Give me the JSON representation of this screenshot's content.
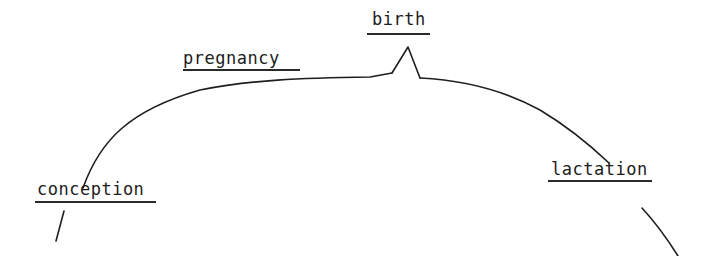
{
  "diagram": {
    "type": "life-cycle curve",
    "stroke_color": "#1e1e1e",
    "background": "#ffffff",
    "labels": [
      {
        "id": "conception",
        "text": "conception"
      },
      {
        "id": "pregnancy",
        "text": "pregnancy"
      },
      {
        "id": "birth",
        "text": "birth"
      },
      {
        "id": "lactation",
        "text": "lactation"
      }
    ],
    "curve_phases": [
      "conception",
      "pregnancy",
      "birth",
      "lactation"
    ],
    "peak_marker": "birth"
  }
}
